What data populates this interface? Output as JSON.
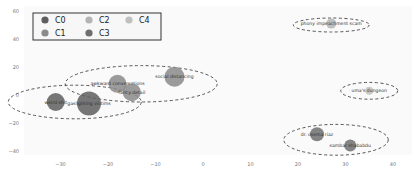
{
  "chart_data": {
    "type": "scatter",
    "title": "",
    "xlabel": "",
    "ylabel": "",
    "xlim": [
      -37,
      40
    ],
    "ylim": [
      -45,
      60
    ],
    "grid": false,
    "x_ticks": [
      -30,
      -20,
      -10,
      0,
      10,
      20,
      30,
      40
    ],
    "y_ticks": [
      60,
      40,
      20,
      0,
      -20,
      -40
    ],
    "legend": {
      "position": "upper left",
      "entries": [
        {
          "name": "C0",
          "color": "#5e5e5e"
        },
        {
          "name": "C1",
          "color": "#8a8a8a"
        },
        {
          "name": "C2",
          "color": "#b4b4b4"
        },
        {
          "name": "C3",
          "color": "#6e6e6e"
        },
        {
          "name": "C4",
          "color": "#c0c0c0"
        }
      ]
    },
    "points": [
      {
        "label": "weird shit",
        "x": -31,
        "y": -5,
        "size": 9,
        "cluster": "C0"
      },
      {
        "label": "gaslighting victims",
        "x": -24,
        "y": -6,
        "size": 12,
        "cluster": "C0"
      },
      {
        "label": "awkward conversations",
        "x": -18,
        "y": 8,
        "size": 9,
        "cluster": "C1"
      },
      {
        "label": "fancy detail",
        "x": -15,
        "y": 2,
        "size": 9,
        "cluster": "C1"
      },
      {
        "label": "social distancing",
        "x": -6,
        "y": 13,
        "size": 10,
        "cluster": "C1"
      },
      {
        "label": "phony impeachment scam",
        "x": 27,
        "y": 51,
        "size": 5,
        "cluster": "C2"
      },
      {
        "label": "uma's dungeon",
        "x": 35,
        "y": 3,
        "size": 4,
        "cluster": "C4"
      },
      {
        "label": "dr. osema riaz",
        "x": 24,
        "y": -28,
        "size": 7,
        "cluster": "C3"
      },
      {
        "label": "sambar shababdu",
        "x": 31,
        "y": -36,
        "size": 6,
        "cluster": "C3"
      }
    ],
    "clusters": [
      {
        "name": "C0",
        "cx": -27,
        "cy": -5,
        "rx": 14,
        "ry": 12
      },
      {
        "name": "C1",
        "cx": -13,
        "cy": 8,
        "rx": 16,
        "ry": 13
      },
      {
        "name": "C2",
        "cx": 27,
        "cy": 50,
        "rx": 8,
        "ry": 5
      },
      {
        "name": "C4",
        "cx": 35,
        "cy": 3,
        "rx": 6,
        "ry": 6
      },
      {
        "name": "C3",
        "cx": 28,
        "cy": -32,
        "rx": 11,
        "ry": 11
      }
    ]
  }
}
